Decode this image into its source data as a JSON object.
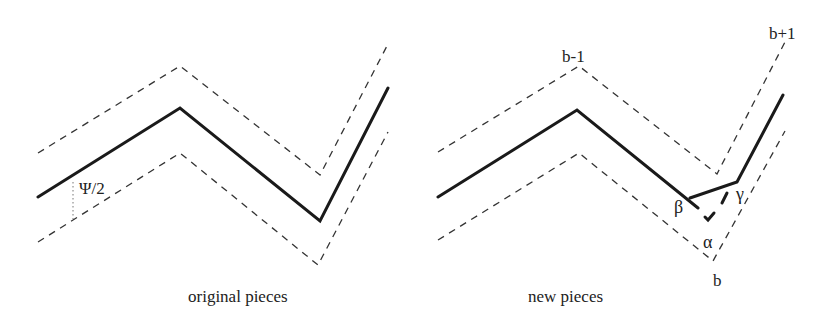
{
  "figure": {
    "panels": [
      {
        "id": "original",
        "caption": "original pieces",
        "annotation": "Ψ/2",
        "polyline_solid": [
          [
            38,
            197
          ],
          [
            180,
            108
          ],
          [
            320,
            221
          ],
          [
            388,
            88
          ]
        ],
        "polyline_upper_dashed": [
          [
            38,
            153
          ],
          [
            180,
            66
          ],
          [
            320,
            175
          ],
          [
            388,
            44
          ]
        ],
        "polyline_lower_dashed": [
          [
            38,
            242
          ],
          [
            180,
            153
          ],
          [
            318,
            265
          ],
          [
            388,
            132
          ]
        ]
      },
      {
        "id": "new",
        "caption": "new pieces",
        "labels": {
          "b_minus_1": "b-1",
          "b_plus_1": "b+1",
          "b": "b",
          "alpha": "α",
          "beta": "β",
          "gamma": "γ"
        },
        "polyline_solid": [
          [
            438,
            197
          ],
          [
            577,
            108
          ],
          [
            688,
            197
          ]
        ],
        "polyline_solid_2": [
          [
            688,
            197
          ],
          [
            737,
            182
          ],
          [
            783,
            95
          ]
        ],
        "polyline_upper_dashed": [
          [
            438,
            152
          ],
          [
            579,
            66
          ],
          [
            717,
            174
          ],
          [
            785,
            42
          ]
        ],
        "polyline_lower_dashed": [
          [
            438,
            240
          ],
          [
            579,
            153
          ],
          [
            713,
            261
          ],
          [
            785,
            131
          ]
        ]
      }
    ]
  }
}
